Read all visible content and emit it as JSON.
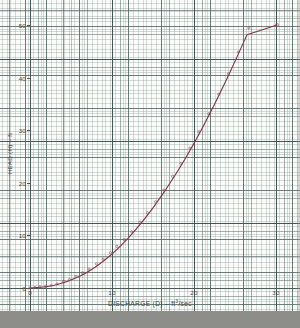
{
  "chart_data": {
    "type": "line",
    "title": "",
    "subtitle": "",
    "xlabel": "DISCHARGE (D) – ft",
    "xlabel_exponent": "3",
    "xlabel_suffix": "/sec",
    "xlabel_full": "DISCHARGE (D) – ft3/sec",
    "ylabel": "HEAD (H) – ft",
    "xlim": [
      0,
      32.5
    ],
    "ylim": [
      -1,
      66
    ],
    "xticks": [
      0,
      10,
      20,
      30
    ],
    "xtick_labels": [
      "0",
      "10",
      "20",
      "30"
    ],
    "yticks": [
      0,
      10,
      20,
      30,
      40,
      50,
      60
    ],
    "ytick_labels": [
      "0",
      "10",
      "20",
      "30",
      "40",
      "50",
      "60"
    ],
    "grid": "engineering-graph-paper",
    "grid_minor_divisions_per_major": 10,
    "legend": "none",
    "series": [
      {
        "name": "Head-Discharge Curve",
        "color": "#7d3a4a",
        "marker": "open-circle",
        "x": [
          0,
          0.6,
          1.2,
          1.9,
          2.6,
          3.3,
          4.1,
          4.8,
          5.6,
          6.4,
          7.2,
          8.1,
          8.9,
          9.8,
          10.6,
          11.5,
          12.4,
          13.4,
          14.3,
          15.3,
          16.3,
          17.4,
          18.4,
          19.5,
          20.6,
          21.8,
          23.0,
          24.2,
          25.4,
          26.7,
          28.0,
          29.3,
          30.1
        ],
        "y": [
          0.0,
          0.1,
          0.2,
          0.3,
          0.5,
          0.8,
          1.2,
          1.6,
          2.2,
          2.9,
          3.6,
          4.6,
          5.5,
          6.7,
          7.9,
          9.2,
          10.7,
          12.5,
          14.3,
          16.4,
          18.6,
          21.2,
          23.7,
          26.6,
          29.7,
          33.1,
          36.8,
          40.7,
          44.8,
          49.4,
          54.3,
          59.5,
          62.9
        ]
      }
    ],
    "annotations": []
  },
  "scan": {
    "paper_color": "#fbfbf9",
    "grid_color": "#5f7873",
    "axis_color": "#4a5a58",
    "curve_color": "#7d3a4a",
    "border_color": "#8d8d8a"
  }
}
